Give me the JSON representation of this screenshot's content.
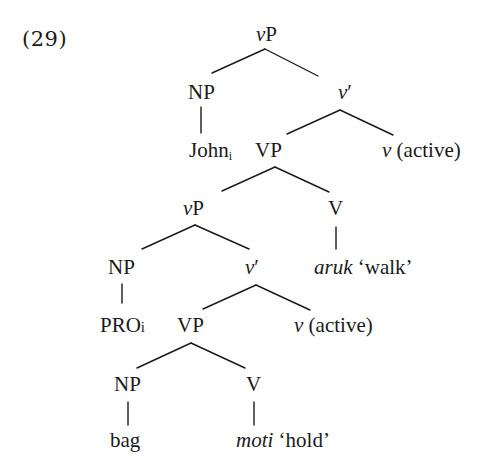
{
  "example_number": "(29)",
  "tree": {
    "root": {
      "label_italic": "v",
      "label_rest": "P"
    },
    "level1": {
      "np": {
        "label": "NP"
      },
      "v_bar": {
        "label_italic": "v",
        "label_rest": "′"
      }
    },
    "john": {
      "word": "John",
      "index": "i"
    },
    "level2": {
      "vp": {
        "label": "VP"
      },
      "v_head": {
        "label_italic": "v",
        "label_rest": " (active)"
      }
    },
    "level3": {
      "vp_inner": {
        "label_italic": "v",
        "label_rest": "P"
      },
      "v": {
        "label": "V"
      }
    },
    "aruk": {
      "word_italic": "aruk",
      "gloss": " ‘walk’"
    },
    "level4": {
      "np": {
        "label": "NP"
      },
      "v_bar": {
        "label_italic": "v",
        "label_rest": "′"
      }
    },
    "pro": {
      "word": "PRO",
      "index": "i"
    },
    "level5": {
      "vp": {
        "label": "VP"
      },
      "v_head": {
        "label_italic": "v",
        "label_rest": " (active)"
      }
    },
    "level6": {
      "np": {
        "label": "NP"
      },
      "v": {
        "label": "V"
      }
    },
    "bag": {
      "word": "bag"
    },
    "moti": {
      "word_italic": "moti",
      "gloss": " ‘hold’"
    }
  },
  "edges": [
    {
      "x1": 265,
      "y1": 49,
      "x2": 212,
      "y2": 73
    },
    {
      "x1": 265,
      "y1": 49,
      "x2": 318,
      "y2": 76
    },
    {
      "x1": 201,
      "y1": 107,
      "x2": 201,
      "y2": 133
    },
    {
      "x1": 340,
      "y1": 110,
      "x2": 287,
      "y2": 134
    },
    {
      "x1": 340,
      "y1": 110,
      "x2": 393,
      "y2": 135
    },
    {
      "x1": 275,
      "y1": 167,
      "x2": 222,
      "y2": 191
    },
    {
      "x1": 275,
      "y1": 167,
      "x2": 329,
      "y2": 192
    },
    {
      "x1": 195,
      "y1": 225,
      "x2": 142,
      "y2": 249
    },
    {
      "x1": 195,
      "y1": 225,
      "x2": 249,
      "y2": 249
    },
    {
      "x1": 336,
      "y1": 227,
      "x2": 336,
      "y2": 249
    },
    {
      "x1": 122,
      "y1": 284,
      "x2": 122,
      "y2": 303
    },
    {
      "x1": 256,
      "y1": 285,
      "x2": 203,
      "y2": 309
    },
    {
      "x1": 256,
      "y1": 285,
      "x2": 310,
      "y2": 310
    },
    {
      "x1": 191,
      "y1": 343,
      "x2": 137,
      "y2": 368
    },
    {
      "x1": 191,
      "y1": 343,
      "x2": 245,
      "y2": 368
    },
    {
      "x1": 128,
      "y1": 402,
      "x2": 128,
      "y2": 425
    },
    {
      "x1": 254,
      "y1": 402,
      "x2": 254,
      "y2": 425
    }
  ]
}
